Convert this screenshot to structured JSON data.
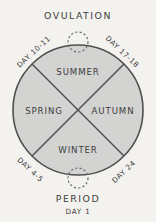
{
  "diagram": {
    "type": "cycle-wheel",
    "title_top": "OVULATION",
    "title_bottom": "PERIOD",
    "subtitle_bottom": "DAY 1",
    "colors": {
      "background": "#f3f2ef",
      "wheel_fill": "#d3d3d2",
      "stroke": "#4f4f4f",
      "text": "#3d3d3d",
      "marker_stroke": "#6a6a6a"
    },
    "seasons": [
      {
        "label": "SUMMER",
        "position": "top",
        "x": 78,
        "y": 72
      },
      {
        "label": "SPRING",
        "position": "left",
        "x": 44,
        "y": 111
      },
      {
        "label": "AUTUMN",
        "position": "right",
        "x": 113,
        "y": 111
      },
      {
        "label": "WINTER",
        "position": "bottom",
        "x": 78,
        "y": 150
      }
    ],
    "day_markers": [
      {
        "label": "DAY 10-11",
        "position": "upper-left",
        "x": 34,
        "y": 52,
        "rotate": -43
      },
      {
        "label": "DAY 17-18",
        "position": "upper-right",
        "x": 122,
        "y": 52,
        "rotate": 43
      },
      {
        "label": "DAY 4-5",
        "position": "lower-left",
        "x": 30,
        "y": 170,
        "rotate": 43
      },
      {
        "label": "DAY 24",
        "position": "lower-right",
        "x": 124,
        "y": 172,
        "rotate": -43
      }
    ],
    "event_markers": [
      {
        "name": "ovulation-marker",
        "x": 78,
        "y": 42,
        "r": 10
      },
      {
        "name": "period-marker",
        "x": 78,
        "y": 178,
        "r": 10
      }
    ]
  }
}
